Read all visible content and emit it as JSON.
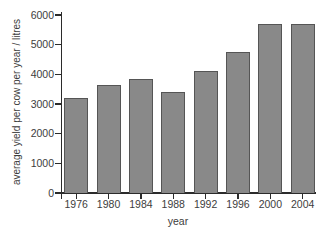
{
  "chart_data": {
    "type": "bar",
    "title": "",
    "categories": [
      "1976",
      "1980",
      "1984",
      "1988",
      "1992",
      "1996",
      "2000",
      "2004"
    ],
    "values": [
      3200,
      3650,
      3850,
      3400,
      4100,
      4750,
      5700,
      5700
    ],
    "xlabel": "year",
    "ylabel": "average yield per cow per year / litres",
    "ylim": [
      0,
      6000
    ],
    "yticks": [
      0,
      1000,
      2000,
      3000,
      4000,
      5000,
      6000
    ],
    "grid": false,
    "legend": false
  },
  "colors": {
    "bar_fill": "#898989",
    "bar_border": "#555555",
    "axis": "#2b2b2b",
    "text": "#3d3d3d",
    "background": "#ffffff"
  }
}
